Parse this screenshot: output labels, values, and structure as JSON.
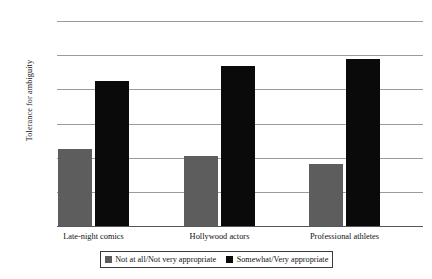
{
  "chart_data": {
    "type": "bar",
    "title": "",
    "xlabel": "",
    "ylabel": "Tolerance for ambiguity",
    "categories": [
      "Late-night comics",
      "Hollywood actors",
      "Professional athletes"
    ],
    "series": [
      {
        "name": "Not at all/Not very appropriate",
        "color": "#5d5d5d",
        "values": [
          2.413,
          2.402,
          2.391
        ]
      },
      {
        "name": "Somewhat/Very appropriate",
        "color": "#0a0a0a",
        "values": [
          2.512,
          2.534,
          2.545
        ]
      }
    ],
    "ylim": [
      2.3,
      2.6
    ],
    "yticks": [
      2.6,
      2.55,
      2.5,
      2.45,
      2.4,
      2.35,
      2.3
    ],
    "ytick_labels": [
      "2.6",
      "2.55",
      "2.5",
      "2.45",
      "2.4",
      "2.35",
      "2.3"
    ],
    "grid": true,
    "legend_position": "bottom"
  },
  "legend": {
    "items": [
      {
        "label": "Not at all/Not very appropriate",
        "swatch": "gray"
      },
      {
        "label": "Somewhat/Very appropriate",
        "swatch": "black"
      }
    ]
  }
}
